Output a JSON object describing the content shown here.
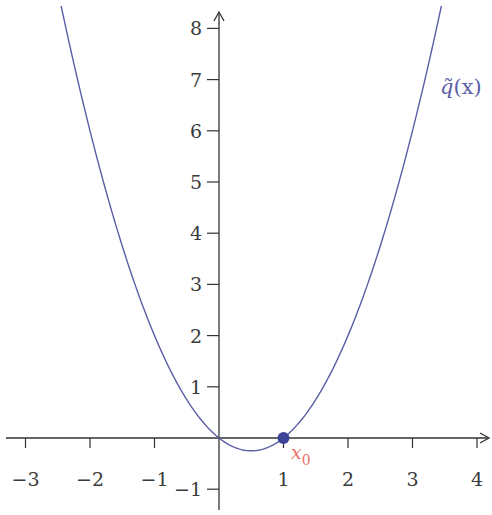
{
  "chart_data": {
    "type": "line",
    "title": "",
    "xlabel": "",
    "ylabel": "",
    "xlim": [
      -3.35,
      4.2
    ],
    "ylim": [
      -1.45,
      8.6
    ],
    "grid": false,
    "x_ticks": [
      -3,
      -2,
      -1,
      1,
      2,
      3,
      4
    ],
    "x_tick_labels": [
      "−3",
      "−2",
      "−1",
      "1",
      "2",
      "3",
      "4"
    ],
    "y_ticks": [
      -1,
      1,
      2,
      3,
      4,
      5,
      6,
      7,
      8
    ],
    "y_tick_labels": [
      "−1",
      "1",
      "2",
      "3",
      "4",
      "5",
      "6",
      "7",
      "8"
    ],
    "series": [
      {
        "name": "q̃(x)",
        "formula": "x^2 - x",
        "color": "#5a5ea6",
        "x": [
          -2.5,
          -2,
          -1.5,
          -1,
          -0.5,
          0,
          0.5,
          1,
          1.5,
          2,
          2.5,
          3,
          3.5
        ],
        "values": [
          8.75,
          6,
          3.75,
          2,
          0.75,
          0,
          -0.25,
          0,
          0.75,
          2,
          3.75,
          6,
          8.75
        ]
      }
    ],
    "annotations": [
      {
        "type": "point",
        "x": 1,
        "y": 0,
        "label": "x₀",
        "label_main": "x",
        "label_sub": "0",
        "color": "#3b4496",
        "label_color": "#e8736a"
      },
      {
        "type": "curve_label",
        "text_main": "q̃",
        "text_rest": "(x)",
        "position": "upper right",
        "color": "#5a5ea6"
      }
    ]
  },
  "labels": {
    "curve_main": "q̃",
    "curve_rest": "(x)",
    "point_main": "x",
    "point_sub": "0"
  }
}
